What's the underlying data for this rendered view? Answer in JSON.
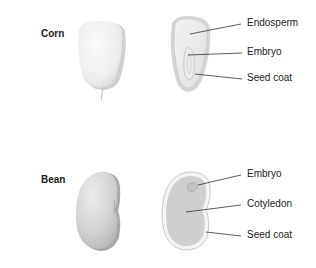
{
  "diagram": {
    "seeds": [
      {
        "name": "Corn",
        "views": [
          "whole-seed",
          "cross-section"
        ],
        "parts": [
          "Endosperm",
          "Embryo",
          "Seed coat"
        ]
      },
      {
        "name": "Bean",
        "views": [
          "whole-seed",
          "cross-section"
        ],
        "parts": [
          "Embryo",
          "Cotyledon",
          "Seed coat"
        ]
      }
    ],
    "colors": {
      "corn_fill": "#f2f2f2",
      "corn_shadow": "#cfcfcf",
      "bean_fill": "#d6d6d6",
      "bean_shadow": "#a9a9a9",
      "leader_line": "#333333"
    }
  }
}
